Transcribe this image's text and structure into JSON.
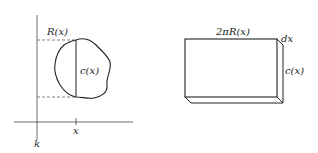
{
  "left_figure": {
    "labels": {
      "radius": "R(x)",
      "chord": "c(x)",
      "x_tick": "x",
      "axis": "k"
    }
  },
  "right_figure": {
    "labels": {
      "width": "2πR(x)",
      "thickness": "dx",
      "height": "c(x)"
    }
  },
  "colors": {
    "stroke": "#222222",
    "dashed": "#666666",
    "background": "#ffffff"
  }
}
